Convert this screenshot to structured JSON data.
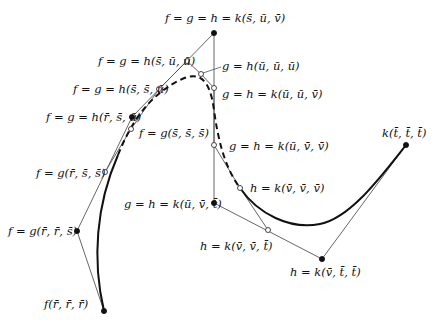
{
  "diagram": {
    "type": "bspline-blossom-control-polygon",
    "colors": {
      "curve": "#111111",
      "polygon": "#555555",
      "background": "#ffffff"
    },
    "points": [
      {
        "id": "p1",
        "label": "f(r̄, r̄, r̄)",
        "x": 104,
        "y": 311,
        "marker": "filled",
        "lx": 44,
        "ly": 308,
        "anchor": "start"
      },
      {
        "id": "p2",
        "label": "f = g(r̄, r̄, s̄)",
        "x": 77,
        "y": 231,
        "marker": "filled",
        "lx": 8,
        "ly": 235,
        "anchor": "start"
      },
      {
        "id": "p3",
        "label": "f = g(r̄, s̄, s̄)",
        "x": 105,
        "y": 172,
        "marker": "open",
        "lx": 36,
        "ly": 177,
        "anchor": "start"
      },
      {
        "id": "p4",
        "label": "f = g(s̄, s̄, s̄)",
        "x": 131,
        "y": 129,
        "marker": "open",
        "lx": 139,
        "ly": 137,
        "anchor": "start"
      },
      {
        "id": "p5",
        "label": "f = g = h(r̄, s̄, ū)",
        "x": 132,
        "y": 117,
        "marker": "filled",
        "lx": 46,
        "ly": 121,
        "anchor": "start"
      },
      {
        "id": "p6",
        "label": "f = g = h(s̄, s̄, ū)",
        "x": 159,
        "y": 89,
        "marker": "open",
        "lx": 73,
        "ly": 93,
        "anchor": "start"
      },
      {
        "id": "p7",
        "label": "f = g = h(s̄, ū, ū)",
        "x": 187,
        "y": 61,
        "marker": "open",
        "lx": 98,
        "ly": 65,
        "anchor": "start"
      },
      {
        "id": "p8",
        "label": "f = g = h = k(s̄, ū, v̄)",
        "x": 214,
        "y": 33,
        "marker": "filled",
        "lx": 165,
        "ly": 22,
        "anchor": "start"
      },
      {
        "id": "p9",
        "label": "g = h(ū, ū, ū)",
        "x": 201,
        "y": 74,
        "marker": "open",
        "lx": 222,
        "ly": 70,
        "anchor": "start"
      },
      {
        "id": "p10",
        "label": "g = h = k(ū, ū, v̄)",
        "x": 214,
        "y": 88,
        "marker": "open",
        "lx": 222,
        "ly": 98,
        "anchor": "start"
      },
      {
        "id": "p11",
        "label": "g = h = k(ū, v̄, v̄)",
        "x": 214,
        "y": 145,
        "marker": "open",
        "lx": 229,
        "ly": 150,
        "anchor": "start"
      },
      {
        "id": "p12",
        "label": "g = h = k(ū, v̄, t̄)",
        "x": 214,
        "y": 203,
        "marker": "filled",
        "lx": 124,
        "ly": 208,
        "anchor": "start"
      },
      {
        "id": "p13",
        "label": "h = k(v̄, v̄, v̄)",
        "x": 240,
        "y": 188,
        "marker": "open",
        "lx": 250,
        "ly": 192,
        "anchor": "start"
      },
      {
        "id": "p14",
        "label": "h = k(v̄, v̄, t̄)",
        "x": 268,
        "y": 230,
        "marker": "open",
        "lx": 200,
        "ly": 250,
        "anchor": "start"
      },
      {
        "id": "p15",
        "label": "h = k(v̄, t̄, t̄)",
        "x": 322,
        "y": 259,
        "marker": "filled",
        "lx": 290,
        "ly": 276,
        "anchor": "start"
      },
      {
        "id": "p16",
        "label": "k(t̄, t̄, t̄)",
        "x": 406,
        "y": 145,
        "marker": "filled",
        "lx": 382,
        "ly": 137,
        "anchor": "start"
      }
    ],
    "polygon_segments": [
      [
        "p1",
        "p2"
      ],
      [
        "p2",
        "p5"
      ],
      [
        "p5",
        "p8"
      ],
      [
        "p8",
        "p12"
      ],
      [
        "p12",
        "p15"
      ],
      [
        "p15",
        "p16"
      ],
      [
        "p3",
        "p4"
      ],
      [
        "p4",
        "p6"
      ],
      [
        "p6",
        "p7"
      ],
      [
        "p7",
        "p9"
      ],
      [
        "p9",
        "p10"
      ],
      [
        "p10",
        "p11"
      ],
      [
        "p11",
        "p13"
      ],
      [
        "p13",
        "p14"
      ]
    ],
    "leader_lines": [
      {
        "from": [
          221,
          67
        ],
        "to": [
          203,
          73
        ]
      }
    ],
    "curves": {
      "solid_left": "M104,311 C92,260 96,205 118,155",
      "dashed_mid": "M118,155 C132,120 150,95 180,80 C200,70 210,80 214,110 C218,140 225,168 240,188",
      "solid_right": "M240,188 C258,214 290,230 320,224 C350,218 380,178 406,145"
    }
  }
}
